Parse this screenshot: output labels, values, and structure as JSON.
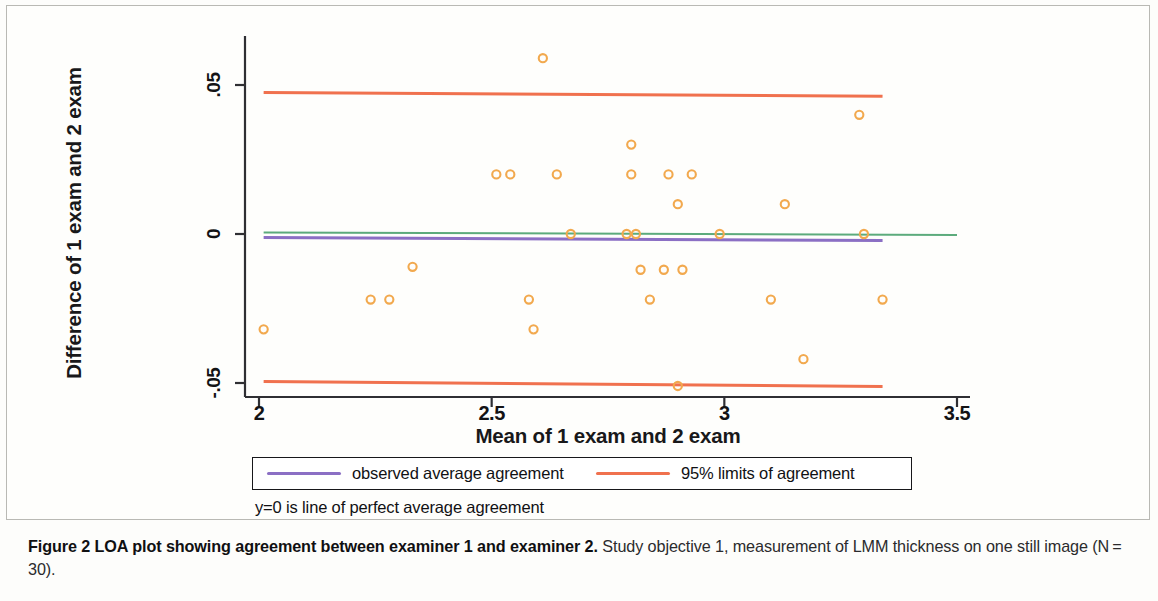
{
  "figure": {
    "caption_bold": "Figure 2 LOA plot showing agreement between examiner 1 and examiner 2.",
    "caption_rest": " Study objective 1, measurement of LMM thickness on one still image (N = 30)."
  },
  "legend": {
    "observed_label": "observed average agreement",
    "loa_label": "95% limits of agreement",
    "note": "y=0 is line of perfect average agreement",
    "observed_color": "#8b6fc4",
    "loa_color": "#f0714e"
  },
  "colors": {
    "marker": "#f2a94e",
    "zero_line": "#5cab7c",
    "observed_line": "#8b6fc4",
    "loa_line": "#f0714e",
    "axis": "#2f2f33"
  },
  "chart_data": {
    "type": "scatter",
    "title": "",
    "xlabel": "Mean of 1 exam and 2 exam",
    "ylabel": "Difference of 1 exam and 2 exam",
    "xlim": [
      1.96,
      3.57
    ],
    "ylim": [
      -0.057,
      0.066
    ],
    "xticks": [
      2,
      2.5,
      3,
      3.5
    ],
    "xtick_labels": [
      "2",
      "2.5",
      "3",
      "3.5"
    ],
    "yticks": [
      0.05,
      0,
      -0.05
    ],
    "ytick_labels": [
      ".05",
      "0",
      "-.05"
    ],
    "grid": false,
    "legend_position": "below-axes",
    "n_points": 30,
    "series": [
      {
        "name": "difference vs mean",
        "marker": "open-circle",
        "color": "#f2a94e",
        "points": [
          {
            "x": 2.01,
            "y": -0.032
          },
          {
            "x": 2.24,
            "y": -0.022
          },
          {
            "x": 2.28,
            "y": -0.022
          },
          {
            "x": 2.33,
            "y": -0.011
          },
          {
            "x": 2.51,
            "y": 0.02
          },
          {
            "x": 2.54,
            "y": 0.02
          },
          {
            "x": 2.58,
            "y": -0.022
          },
          {
            "x": 2.59,
            "y": -0.032
          },
          {
            "x": 2.61,
            "y": 0.059
          },
          {
            "x": 2.64,
            "y": 0.02
          },
          {
            "x": 2.67,
            "y": 0.0
          },
          {
            "x": 2.79,
            "y": 0.0
          },
          {
            "x": 2.8,
            "y": 0.03
          },
          {
            "x": 2.8,
            "y": 0.02
          },
          {
            "x": 2.81,
            "y": 0.0
          },
          {
            "x": 2.82,
            "y": -0.012
          },
          {
            "x": 2.84,
            "y": -0.022
          },
          {
            "x": 2.87,
            "y": -0.012
          },
          {
            "x": 2.88,
            "y": 0.02
          },
          {
            "x": 2.9,
            "y": -0.051
          },
          {
            "x": 2.9,
            "y": 0.01
          },
          {
            "x": 2.91,
            "y": -0.012
          },
          {
            "x": 2.93,
            "y": 0.02
          },
          {
            "x": 2.99,
            "y": 0.0
          },
          {
            "x": 3.1,
            "y": -0.022
          },
          {
            "x": 3.13,
            "y": 0.01
          },
          {
            "x": 3.17,
            "y": -0.042
          },
          {
            "x": 3.29,
            "y": 0.04
          },
          {
            "x": 3.3,
            "y": 0.0
          },
          {
            "x": 3.34,
            "y": -0.022
          }
        ]
      }
    ],
    "reference_lines": [
      {
        "name": "upper-limit-of-agreement",
        "y_start": 0.0475,
        "y_end": 0.0462,
        "x_start": 2.01,
        "x_end": 3.34,
        "color": "#f0714e",
        "label": "95% limits of agreement"
      },
      {
        "name": "lower-limit-of-agreement",
        "y_start": -0.0495,
        "y_end": -0.0512,
        "x_start": 2.01,
        "x_end": 3.34,
        "color": "#f0714e",
        "label": "95% limits of agreement"
      },
      {
        "name": "observed-average-agreement",
        "y_start": -0.0012,
        "y_end": -0.0022,
        "x_start": 2.01,
        "x_end": 3.34,
        "color": "#8b6fc4",
        "label": "observed average agreement"
      },
      {
        "name": "zero-line",
        "y_start": 0.0005,
        "y_end": -0.0003,
        "x_start": 2.01,
        "x_end": 3.5,
        "color": "#5cab7c",
        "label": "y=0 is line of perfect average agreement"
      }
    ]
  }
}
